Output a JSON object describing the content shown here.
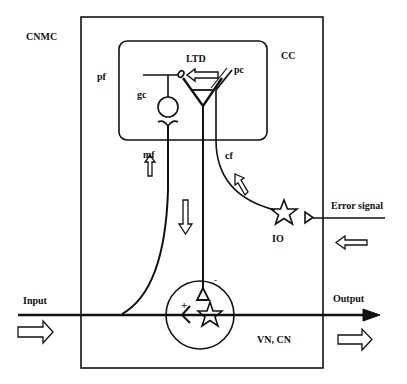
{
  "labels": {
    "outer_region": "CNMC",
    "cortex": "CC",
    "plasticity": "LTD",
    "parallel_fiber": "pf",
    "granule_cell": "gc",
    "purkinje_cell": "pc",
    "mossy_fiber": "mf",
    "climbing_fiber": "cf",
    "inferior_olive": "IO",
    "error_signal": "Error signal",
    "input": "Input",
    "output": "Output",
    "nuclei": "VN, CN",
    "excitatory_sign": "+",
    "inhibitory_sign": "-"
  },
  "colors": {
    "stroke": "#111111",
    "background": "#ffffff"
  }
}
